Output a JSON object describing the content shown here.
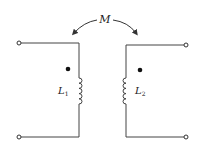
{
  "diagram": {
    "type": "coupled-inductors",
    "mutual_inductance_label": "M",
    "inductors": [
      {
        "label": "L",
        "subscript": "1",
        "dot": "top"
      },
      {
        "label": "L",
        "subscript": "2",
        "dot": "top"
      }
    ],
    "terminals": 4,
    "colors": {
      "line": "#444444",
      "dot": "#111111",
      "background": "#ffffff"
    }
  }
}
